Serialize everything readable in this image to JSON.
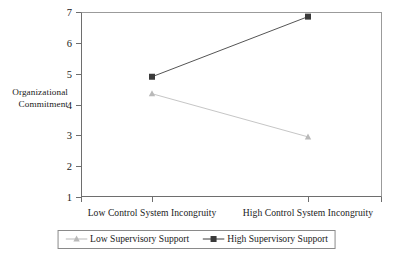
{
  "chart_data": {
    "type": "line",
    "title": "",
    "subtitle": "",
    "xlabel": "",
    "ylabel": "Organizational Commitment",
    "ylabel_lines": [
      "Organizational",
      "Commitment"
    ],
    "categories": [
      "Low Control System Incongruity",
      "High Control System Incongruity"
    ],
    "ylim": [
      1,
      7
    ],
    "yticks": [
      1,
      2,
      3,
      4,
      5,
      6,
      7
    ],
    "ytick_labels": [
      "1",
      "2",
      "3",
      "4",
      "5",
      "6",
      "7"
    ],
    "grid": false,
    "legend_position": "bottom-center",
    "series": [
      {
        "name": "Low Supervisory Support",
        "values": [
          4.35,
          2.95
        ],
        "marker": "triangle",
        "color": "#b9b9b9",
        "line_color": "#c6c6c6"
      },
      {
        "name": "High Supervisory Support",
        "values": [
          4.9,
          6.85
        ],
        "marker": "square",
        "color": "#3a3a3a",
        "line_color": "#555555"
      }
    ]
  },
  "axes": {
    "y_title_lines": [
      "Organizational",
      "Commitment"
    ],
    "y_tick_labels": [
      "7",
      "6",
      "5",
      "4",
      "3",
      "2",
      "1"
    ],
    "x_tick_labels": [
      "Low Control System Incongruity",
      "High Control System Incongruity"
    ]
  },
  "legend": {
    "entries": [
      {
        "label": "Low Supervisory Support",
        "marker": "triangle-marker",
        "color": "#b9b9b9"
      },
      {
        "label": "High Supervisory Support",
        "marker": "square-marker",
        "color": "#3a3a3a"
      }
    ]
  },
  "colors": {
    "axis": "#6e6e6e",
    "frame": "#9b9b9b",
    "text": "#1a1a1a",
    "low_series": "#b9b9b9",
    "high_series": "#3a3a3a",
    "background": "#ffffff"
  }
}
